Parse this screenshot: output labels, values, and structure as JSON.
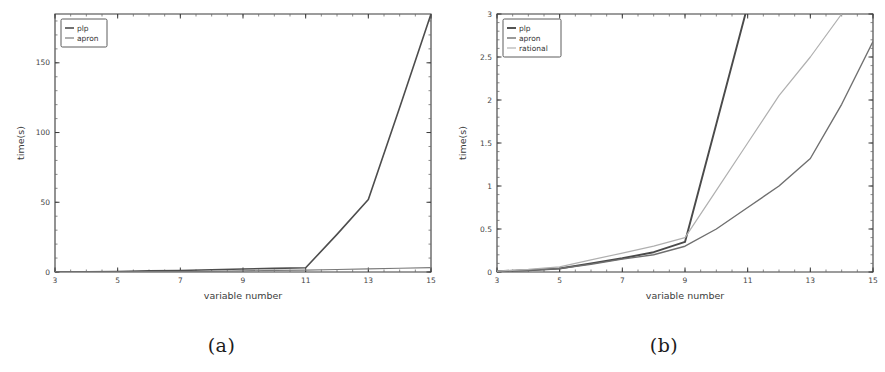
{
  "figure": {
    "panels": [
      {
        "caption": "(a)",
        "chart_data": {
          "type": "line",
          "title": "",
          "xlabel": "variable number",
          "ylabel": "time(s)",
          "xlim": [
            3,
            15
          ],
          "ylim": [
            0,
            185
          ],
          "xticks": [
            3,
            5,
            7,
            9,
            11,
            13,
            15
          ],
          "xticklabels": [
            "3",
            "5",
            "7",
            "9",
            "11",
            "13",
            "15"
          ],
          "yticks": [
            0,
            50,
            100,
            150
          ],
          "yticklabels": [
            "0",
            "50",
            "100",
            "150"
          ],
          "x_minor_step": 0.5,
          "y_minor_step": 10,
          "grid": false,
          "legend_position": "top-left",
          "x": [
            3,
            4,
            5,
            6,
            7,
            8,
            9,
            10,
            11,
            12,
            13,
            14,
            15
          ],
          "series": [
            {
              "name": "plp",
              "color": "#4d4d4d",
              "width": 1.6,
              "values": [
                0.1,
                0.2,
                0.4,
                0.8,
                1.1,
                1.6,
                2.2,
                2.6,
                3.0,
                27.0,
                52.0,
                118.0,
                185.0
              ]
            },
            {
              "name": "apron",
              "color": "#7a7a7a",
              "width": 1.2,
              "values": [
                0.05,
                0.08,
                0.12,
                0.2,
                0.3,
                0.5,
                0.8,
                1.1,
                1.4,
                1.8,
                2.2,
                2.7,
                3.2
              ]
            }
          ]
        }
      },
      {
        "caption": "(b)",
        "chart_data": {
          "type": "line",
          "title": "",
          "xlabel": "variable number",
          "ylabel": "time(s)",
          "xlim": [
            3,
            15
          ],
          "ylim": [
            0,
            3
          ],
          "xticks": [
            3,
            5,
            7,
            9,
            11,
            13,
            15
          ],
          "xticklabels": [
            "3",
            "5",
            "7",
            "9",
            "11",
            "13",
            "15"
          ],
          "yticks": [
            0,
            0.5,
            1,
            1.5,
            2,
            2.5,
            3
          ],
          "yticklabels": [
            "0",
            "0.5",
            "1",
            "1.5",
            "2",
            "2.5",
            "3"
          ],
          "x_minor_step": 0.5,
          "y_minor_step": 0.1,
          "grid": false,
          "legend_position": "top-left",
          "x": [
            3,
            4,
            5,
            6,
            7,
            8,
            9,
            10,
            11,
            12,
            13,
            14,
            15
          ],
          "series": [
            {
              "name": "plp",
              "color": "#4a4a4a",
              "width": 1.9,
              "values": [
                0.01,
                0.02,
                0.04,
                0.1,
                0.16,
                0.23,
                0.35,
                1.72,
                3.1,
                null,
                null,
                null,
                null
              ]
            },
            {
              "name": "apron",
              "color": "#6f6f6f",
              "width": 1.4,
              "values": [
                0.01,
                0.02,
                0.04,
                0.09,
                0.15,
                0.2,
                0.3,
                0.5,
                0.75,
                1.0,
                1.32,
                1.95,
                2.68
              ]
            },
            {
              "name": "rational",
              "color": "#b0b0b0",
              "width": 1.2,
              "values": [
                0.01,
                0.03,
                0.06,
                0.14,
                0.22,
                0.3,
                0.4,
                0.95,
                1.5,
                2.05,
                2.5,
                3.0,
                null
              ]
            }
          ]
        }
      }
    ]
  }
}
